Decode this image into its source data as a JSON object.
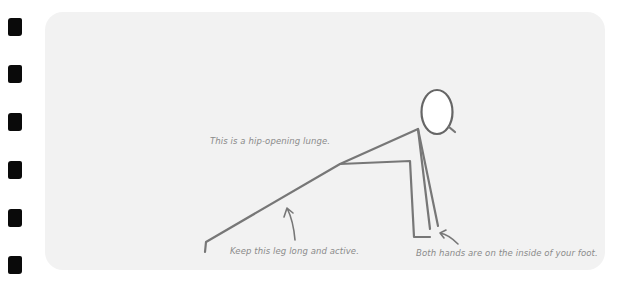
{
  "page": {
    "background": "#ffffff",
    "binding_holes": 6
  },
  "card": {
    "background": "#f2f2f2"
  },
  "illustration": {
    "subject": "stick-figure-hip-opening-lunge",
    "stroke_color": "#777777"
  },
  "captions": {
    "hip": "This is a hip-opening lunge.",
    "leg": "Keep this leg long and active.",
    "hands": "Both hands are on the inside of your foot."
  }
}
